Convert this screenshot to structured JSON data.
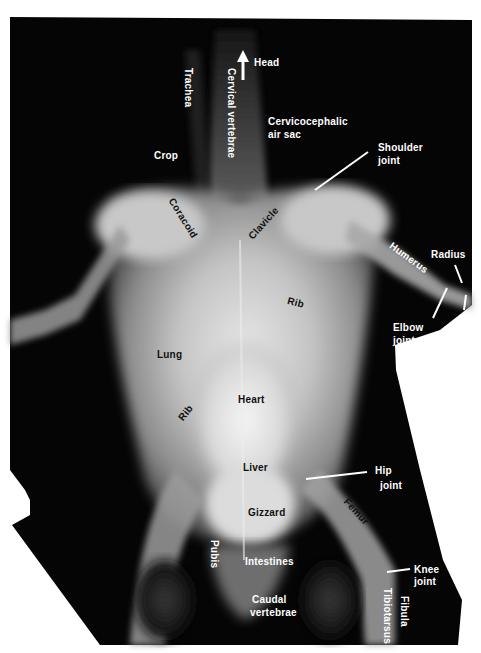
{
  "figure": {
    "colors": {
      "background": "#ffffff",
      "film": "#050505",
      "label_light": "#ffffff",
      "label_dark": "#111111"
    },
    "orientation_arrow": {
      "label": "Head",
      "direction": "up"
    },
    "labels": [
      {
        "id": "head",
        "text": "Head"
      },
      {
        "id": "trachea",
        "text": "Trachea"
      },
      {
        "id": "cervical_vertebrae",
        "text": "Cervical vertebrae"
      },
      {
        "id": "cervicocephalic_air_sac_1",
        "text": "Cervicocephalic"
      },
      {
        "id": "cervicocephalic_air_sac_2",
        "text": "air sac"
      },
      {
        "id": "crop",
        "text": "Crop"
      },
      {
        "id": "shoulder_joint_1",
        "text": "Shoulder"
      },
      {
        "id": "shoulder_joint_2",
        "text": "joint"
      },
      {
        "id": "coracoid",
        "text": "Coracoid"
      },
      {
        "id": "clavicle",
        "text": "Clavicle"
      },
      {
        "id": "humerus",
        "text": "Humerus"
      },
      {
        "id": "radius",
        "text": "Radius"
      },
      {
        "id": "rib_right",
        "text": "Rib"
      },
      {
        "id": "elbow_joint_1",
        "text": "Elbow"
      },
      {
        "id": "elbow_joint_2",
        "text": "joint"
      },
      {
        "id": "ulna",
        "text": "Ulna"
      },
      {
        "id": "lung",
        "text": "Lung"
      },
      {
        "id": "rib_left",
        "text": "Rib"
      },
      {
        "id": "heart",
        "text": "Heart"
      },
      {
        "id": "liver",
        "text": "Liver"
      },
      {
        "id": "hip_joint_1",
        "text": "Hip"
      },
      {
        "id": "hip_joint_2",
        "text": "joint"
      },
      {
        "id": "gizzard",
        "text": "Gizzard"
      },
      {
        "id": "femur",
        "text": "Femur"
      },
      {
        "id": "pubis",
        "text": "Pubis"
      },
      {
        "id": "intestines",
        "text": "Intestines"
      },
      {
        "id": "knee_joint_1",
        "text": "Knee"
      },
      {
        "id": "knee_joint_2",
        "text": "joint"
      },
      {
        "id": "caudal_vertebrae_1",
        "text": "Caudal"
      },
      {
        "id": "caudal_vertebrae_2",
        "text": "vertebrae"
      },
      {
        "id": "fibula",
        "text": "Fibula"
      },
      {
        "id": "tibiotarsus",
        "text": "Tibiotarsus"
      }
    ]
  }
}
